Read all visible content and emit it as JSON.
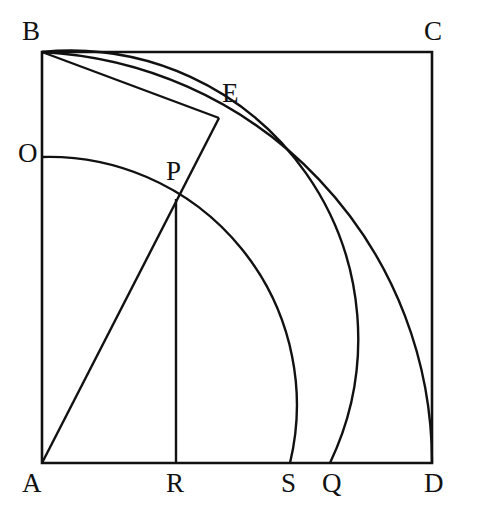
{
  "figure": {
    "type": "geometry-diagram",
    "stroke_color": "#111111",
    "background_color": "#ffffff",
    "square": {
      "corners": {
        "A": [
          42,
          463
        ],
        "B": [
          42,
          52
        ],
        "C": [
          432,
          52
        ],
        "D": [
          432,
          463
        ]
      }
    },
    "arcs": [
      {
        "name": "arc-B-D",
        "center": "A",
        "radius": 411,
        "from": "B",
        "to": "D"
      },
      {
        "name": "arc-B-Q",
        "center": "A",
        "radius": 288,
        "from": "B",
        "to": "Q"
      },
      {
        "name": "arc-O-S",
        "center": "A",
        "radius": 248,
        "from": "O",
        "to": "S"
      }
    ],
    "segments": [
      {
        "name": "segment-A-E",
        "from": "A",
        "to": "E"
      },
      {
        "name": "segment-B-E",
        "from": "B",
        "to": "E"
      },
      {
        "name": "segment-P-R",
        "from": "P",
        "to": "R"
      }
    ],
    "points": [
      {
        "id": "A",
        "label": "A",
        "x": 42,
        "y": 463,
        "label_x": 22,
        "label_y": 470
      },
      {
        "id": "B",
        "label": "B",
        "x": 42,
        "y": 52,
        "label_x": 22,
        "label_y": 18
      },
      {
        "id": "C",
        "label": "C",
        "x": 432,
        "y": 52,
        "label_x": 424,
        "label_y": 18
      },
      {
        "id": "D",
        "label": "D",
        "x": 432,
        "y": 463,
        "label_x": 424,
        "label_y": 470
      },
      {
        "id": "O",
        "label": "O",
        "x": 42,
        "y": 157,
        "label_x": 18,
        "label_y": 140
      },
      {
        "id": "P",
        "label": "P",
        "x": 176,
        "y": 199,
        "label_x": 166,
        "label_y": 158
      },
      {
        "id": "E",
        "label": "E",
        "x": 219,
        "y": 118,
        "label_x": 222,
        "label_y": 80
      },
      {
        "id": "R",
        "label": "R",
        "x": 176,
        "y": 463,
        "label_x": 166,
        "label_y": 470
      },
      {
        "id": "S",
        "label": "S",
        "x": 290,
        "y": 463,
        "label_x": 281,
        "label_y": 470
      },
      {
        "id": "Q",
        "label": "Q",
        "x": 330,
        "y": 463,
        "label_x": 322,
        "label_y": 470
      }
    ]
  }
}
